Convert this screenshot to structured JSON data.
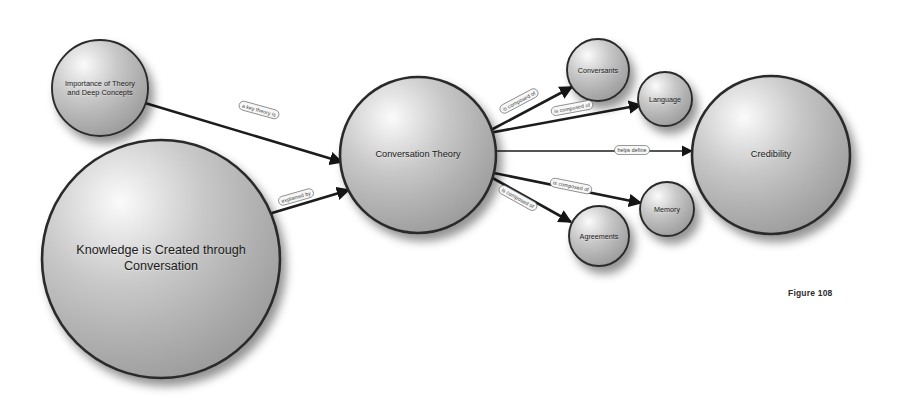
{
  "figure": {
    "caption": "Figure 108",
    "caption_x": 788,
    "caption_y": 288
  },
  "nodes": [
    {
      "id": "importance-of-theory",
      "label": "Importance of Theory\nand Deep Concepts",
      "cx": 100,
      "cy": 88,
      "r": 48,
      "font_size": 7.4
    },
    {
      "id": "knowledge-created",
      "label": "Knowledge is Created through\nConversation",
      "cx": 161,
      "cy": 259,
      "r": 119,
      "font_size": 12.6
    },
    {
      "id": "conversation-theory",
      "label": "Conversation Theory",
      "cx": 418,
      "cy": 155,
      "r": 78,
      "font_size": 9.2
    },
    {
      "id": "conversants",
      "label": "Conversants",
      "cx": 598,
      "cy": 70,
      "r": 31,
      "font_size": 7.2
    },
    {
      "id": "language",
      "label": "Language",
      "cx": 665,
      "cy": 99,
      "r": 27,
      "font_size": 7.2
    },
    {
      "id": "memory",
      "label": "Memory",
      "cx": 667,
      "cy": 209,
      "r": 27,
      "font_size": 7.2
    },
    {
      "id": "agreements",
      "label": "Agreements",
      "cx": 599,
      "cy": 236,
      "r": 30,
      "font_size": 7.2
    },
    {
      "id": "credibility",
      "label": "Credibility",
      "cx": 771,
      "cy": 155,
      "r": 79,
      "font_size": 9.2
    }
  ],
  "edges": [
    {
      "id": "importance-to-theory",
      "from": "importance-of-theory",
      "to": "conversation-theory",
      "label": "a key theory is",
      "x1": 145,
      "y1": 103,
      "x2": 342,
      "y2": 162,
      "lx": 259,
      "ly": 110,
      "angle": 15.5,
      "pill_w": 41,
      "pill_h": 9,
      "thick": 2.6
    },
    {
      "id": "knowledge-to-theory",
      "from": "knowledge-created",
      "to": "conversation-theory",
      "label": "explained by",
      "x1": 262,
      "y1": 216,
      "x2": 349,
      "y2": 190,
      "lx": 296,
      "ly": 197,
      "angle": -16.0,
      "pill_w": 36,
      "pill_h": 9,
      "thick": 2.6
    },
    {
      "id": "theory-to-conversants",
      "from": "conversation-theory",
      "to": "conversants",
      "label": "is composed of",
      "x1": 489,
      "y1": 131,
      "x2": 572,
      "y2": 87,
      "lx": 519,
      "ly": 101,
      "angle": -28.0,
      "pill_w": 42,
      "pill_h": 9,
      "thick": 2.6
    },
    {
      "id": "theory-to-language",
      "from": "conversation-theory",
      "to": "language",
      "label": "is composed of",
      "x1": 489,
      "y1": 133,
      "x2": 641,
      "y2": 105,
      "lx": 572,
      "ly": 108,
      "angle": -10.5,
      "pill_w": 42,
      "pill_h": 9,
      "thick": 2.6
    },
    {
      "id": "theory-to-credibility",
      "from": "conversation-theory",
      "to": "credibility",
      "label": "helps define",
      "x1": 489,
      "y1": 151,
      "x2": 692,
      "y2": 151,
      "lx": 632,
      "ly": 150,
      "angle": 0,
      "pill_w": 35,
      "pill_h": 9,
      "thick": 1.6
    },
    {
      "id": "theory-to-memory",
      "from": "conversation-theory",
      "to": "memory",
      "label": "is composed of",
      "x1": 489,
      "y1": 172,
      "x2": 641,
      "y2": 203,
      "lx": 571,
      "ly": 186,
      "angle": 11.5,
      "pill_w": 42,
      "pill_h": 9,
      "thick": 2.6
    },
    {
      "id": "theory-to-agreements",
      "from": "conversation-theory",
      "to": "agreements",
      "label": "is composed of",
      "x1": 489,
      "y1": 176,
      "x2": 571,
      "y2": 222,
      "lx": 518,
      "ly": 198,
      "angle": 29.0,
      "pill_w": 42,
      "pill_h": 9,
      "thick": 2.6
    }
  ],
  "colors": {
    "node_fill_highlight": "#f2f2f2",
    "node_fill_mid": "#b9b9b9",
    "node_fill_edge": "#9a9a9a",
    "node_stroke": "#2b2b2b",
    "edge_stroke": "#1c1c1c",
    "pill_fill": "#f7f7f7",
    "pill_stroke": "#6e6e6e",
    "background": "#ffffff",
    "text": "#1a1a1a"
  }
}
